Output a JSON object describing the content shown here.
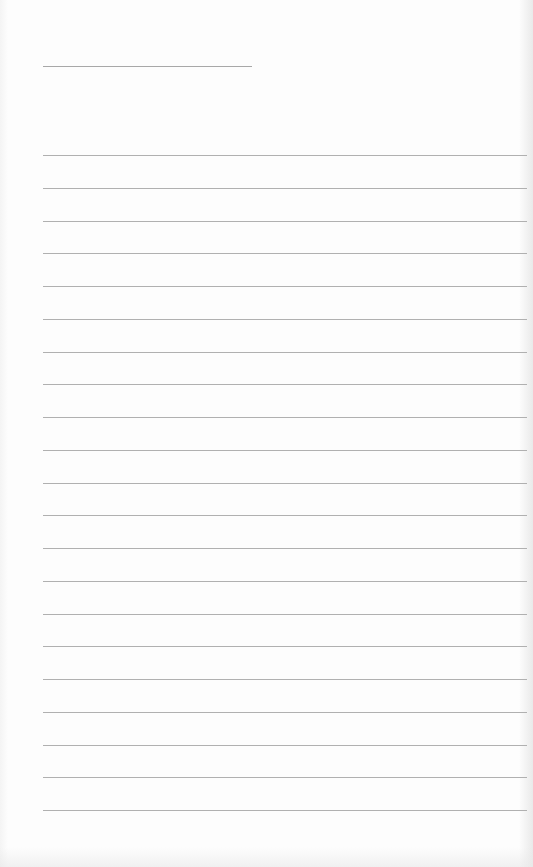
{
  "page": {
    "type": "lined-paper",
    "background": "#fdfdfd",
    "line_color": "#b0b0b0",
    "title_line": {
      "x": 43,
      "y": 66,
      "width": 209
    },
    "ruled_lines": {
      "count": 21,
      "start_y": 155,
      "spacing": 32.75,
      "left_margin": 43
    }
  }
}
